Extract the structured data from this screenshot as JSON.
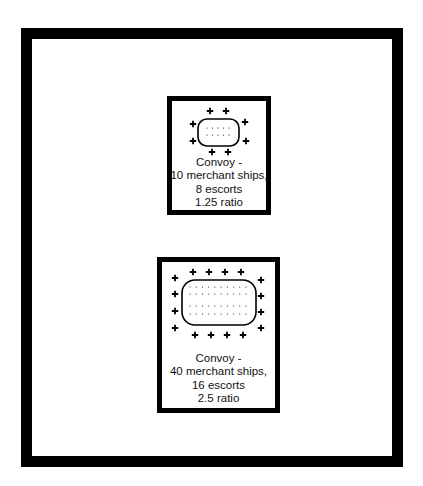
{
  "diagram": {
    "convoys": [
      {
        "id": "small",
        "title": "Convoy -",
        "ships_line": "10 merchant ships,",
        "escorts_line": "8 escorts",
        "ratio_line": "1.25 ratio",
        "merchant_ships": 10,
        "escorts": 8,
        "ratio": 1.25,
        "merchant_rows": 2,
        "merchant_per_row": 5
      },
      {
        "id": "large",
        "title": "Convoy -",
        "ships_line": "40 merchant ships,",
        "escorts_line": "16 escorts",
        "ratio_line": "2.5 ratio",
        "merchant_ships": 40,
        "escorts": 16,
        "ratio": 2.5,
        "merchant_rows": 4,
        "merchant_per_row": 10
      }
    ],
    "symbols": {
      "escort": "+",
      "merchant": "·"
    },
    "colors": {
      "ink": "#000000",
      "background": "#ffffff"
    }
  }
}
